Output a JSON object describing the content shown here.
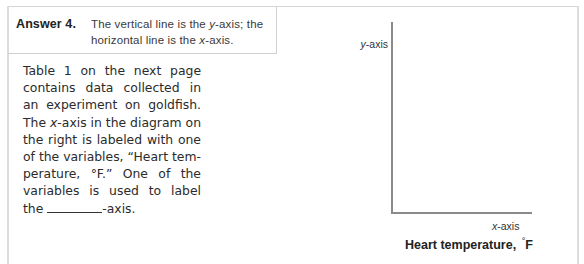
{
  "answer": {
    "label": "Answer 4.",
    "text_part1": "The vertical line is the ",
    "text_y": "y",
    "text_part2": "-axis; the horizontal line is the ",
    "text_x": "x",
    "text_part3": "-axis."
  },
  "body": {
    "part1": "Table 1 on the next page contains data collected in an experiment on goldfish. The ",
    "x_italic": "x",
    "part2": "-axis in the diagram on the right is labeled with one of the variables, “Heart tem-perature, °F.” One of the variables is used to label the ",
    "part3": "-axis."
  },
  "diagram": {
    "y_axis_italic": "y",
    "y_axis_suffix": "-axis",
    "x_axis_italic": "x",
    "x_axis_suffix": "-axis",
    "x_variable": "Heart temperature,",
    "x_variable_degree": "°",
    "x_variable_unit": "F"
  }
}
